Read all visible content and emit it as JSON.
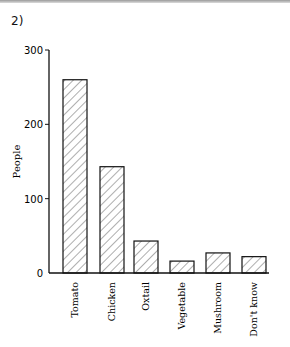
{
  "figure_label": "2)",
  "chart_data": {
    "type": "bar",
    "title": "",
    "xlabel": "",
    "ylabel": "People",
    "categories": [
      "Tomato",
      "Chicken",
      "Oxtail",
      "Vegetable",
      "Mushroom",
      "Don't know"
    ],
    "values": [
      260,
      143,
      43,
      16,
      27,
      22
    ],
    "yticks": [
      0,
      100,
      200,
      300
    ],
    "ylim": [
      0,
      300
    ],
    "grid": false,
    "legend": null,
    "bar_fill": "diagonal-hatch"
  }
}
